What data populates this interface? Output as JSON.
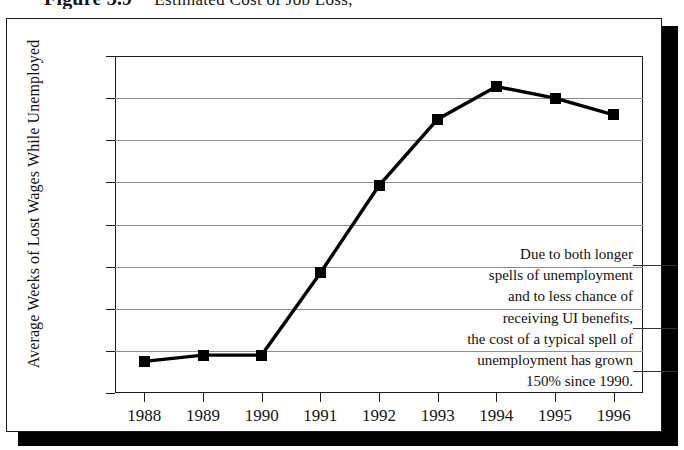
{
  "figure": {
    "number": "Figure 3.9",
    "title": "Estimated Cost of Job Loss,"
  },
  "chart_data": {
    "type": "line",
    "title": "Estimated Cost of Job Loss,",
    "xlabel": "",
    "ylabel": "Average Weeks of Lost Wages While Unemployed",
    "categories": [
      "1988",
      "1989",
      "1990",
      "1991",
      "1992",
      "1993",
      "1994",
      "1995",
      "1996"
    ],
    "values": [
      9.5,
      9.8,
      9.8,
      13.7,
      17.85,
      21.0,
      22.55,
      22.0,
      21.2
    ],
    "series": [
      {
        "name": "Average Weeks of Lost Wages While Unemployed",
        "values": [
          9.5,
          9.8,
          9.8,
          13.7,
          17.85,
          21.0,
          22.55,
          22.0,
          21.2
        ]
      }
    ],
    "ylim": [
      8,
      24
    ],
    "yticks": [
      8,
      10,
      12,
      14,
      16,
      18,
      20,
      22,
      24
    ],
    "ytick_labels": [
      "8",
      "10",
      "12",
      "14",
      "16",
      "18",
      "20",
      "22",
      "24"
    ],
    "xtick_labels": [
      "1988",
      "1989",
      "1990",
      "1991",
      "1992",
      "1993",
      "1994",
      "1995",
      "1996"
    ],
    "grid": "horizontal",
    "legend": "none",
    "marker": "filled-square",
    "line_color": "#000000",
    "grid_color": "#8d8d8d",
    "annotations": [
      {
        "lines": [
          "Due to both longer",
          "spells of unemployment",
          "and to less chance of",
          "receiving UI benefits,",
          "the cost of a typical spell of",
          "unemployment has grown",
          "150% since 1990."
        ],
        "text": "Due to both longer spells of unemployment and to less chance of receiving UI benefits, the cost of a typical spell of unemployment has grown 150% since 1990."
      }
    ]
  },
  "colors": {
    "line": "#000000",
    "marker": "#000000",
    "grid": "#8d8d8d",
    "frame": "#1b1b1b",
    "shadow": "#000000",
    "background": "#ffffff",
    "text": "#141414"
  }
}
